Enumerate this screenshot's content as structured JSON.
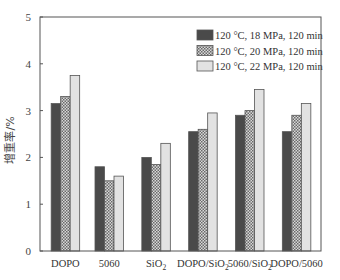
{
  "chart_data": {
    "type": "bar",
    "title": "",
    "xlabel": "",
    "ylabel": "增重率/%",
    "ylim": [
      0,
      5
    ],
    "yticks": [
      0,
      1,
      2,
      3,
      4,
      5
    ],
    "grid": false,
    "legend_position": "upper right",
    "categories": [
      "DOPO",
      "5060",
      "SiO2",
      "DOPO/SiO2",
      "5060/SiO2",
      "DOPO/5060"
    ],
    "category_display": [
      {
        "main": "DOPO",
        "sub": ""
      },
      {
        "main": "5060",
        "sub": ""
      },
      {
        "main": "SiO",
        "sub": "2"
      },
      {
        "main": "DOPO/SiO",
        "sub": "2"
      },
      {
        "main": "5060/SiO",
        "sub": "2"
      },
      {
        "main": "DOPO/5060",
        "sub": ""
      }
    ],
    "series": [
      {
        "name": "120 °C, 18 MPa, 120 min",
        "color": "#4a4a4a",
        "pattern": "solid",
        "values": [
          3.15,
          1.8,
          2.0,
          2.55,
          2.9,
          2.55
        ]
      },
      {
        "name": "120 °C, 20 MPa, 120 min",
        "color": "#9a9a9a",
        "pattern": "checker",
        "values": [
          3.3,
          1.5,
          1.85,
          2.6,
          3.0,
          2.9
        ]
      },
      {
        "name": "120 °C, 22 MPa, 120 min",
        "color": "#e2e2e2",
        "pattern": "solid",
        "values": [
          3.75,
          1.6,
          2.3,
          2.95,
          3.45,
          3.15
        ]
      }
    ]
  }
}
